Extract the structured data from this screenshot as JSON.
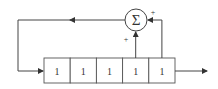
{
  "diagram": {
    "type": "linear feedback shift register",
    "register": {
      "cells": [
        "1",
        "1",
        "1",
        "1",
        "1"
      ]
    },
    "adder": {
      "symbol": "Σ",
      "inputs": [
        {
          "from": "cell-4",
          "sign": "+"
        },
        {
          "from": "cell-5",
          "sign": "+"
        }
      ]
    },
    "feedback": "adder output loops back to register input (left)",
    "output": "arrow exiting right of register"
  }
}
